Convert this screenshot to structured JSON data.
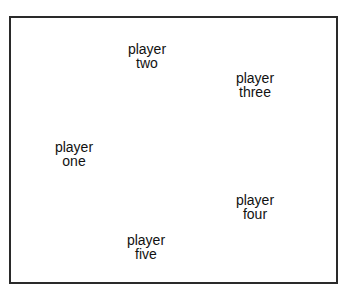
{
  "diagram": {
    "players": [
      {
        "line1": "player",
        "line2": "two",
        "x": 147,
        "y": 42
      },
      {
        "line1": "player",
        "line2": "three",
        "x": 255,
        "y": 71
      },
      {
        "line1": "player",
        "line2": "one",
        "x": 74,
        "y": 140
      },
      {
        "line1": "player",
        "line2": "four",
        "x": 255,
        "y": 193
      },
      {
        "line1": "player",
        "line2": "five",
        "x": 146,
        "y": 233
      }
    ]
  }
}
